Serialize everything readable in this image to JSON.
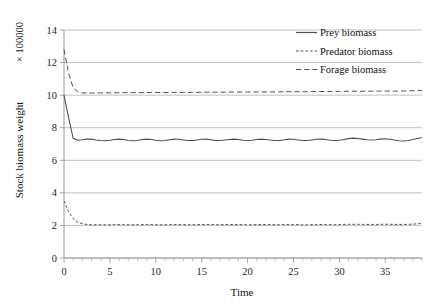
{
  "chart_data": {
    "type": "line",
    "title": "",
    "xlabel": "Time",
    "ylabel": "Stock biomass weight",
    "y_unit_label": "× 100000",
    "xlim": [
      0,
      39
    ],
    "ylim": [
      0,
      14
    ],
    "xticks": [
      0,
      5,
      10,
      15,
      20,
      25,
      30,
      35
    ],
    "xtick_labels": [
      "0",
      "5",
      "10",
      "15",
      "20",
      "25",
      "30",
      "35"
    ],
    "x_minor_tick_step": 1,
    "yticks": [
      0,
      2,
      4,
      6,
      8,
      10,
      12,
      14
    ],
    "ytick_labels": [
      "0",
      "2",
      "4",
      "6",
      "8",
      "10",
      "12",
      "14"
    ],
    "grid": "horizontal",
    "legend_position": "top-right",
    "legend_entries": [
      "Prey biomass",
      "Predator biomass",
      "Forage biomass"
    ],
    "x": [
      0,
      0.5,
      1,
      1.5,
      2,
      2.5,
      3,
      3.5,
      4,
      4.5,
      5,
      5.5,
      6,
      6.5,
      7,
      7.5,
      8,
      8.5,
      9,
      9.5,
      10,
      10.5,
      11,
      11.5,
      12,
      12.5,
      13,
      13.5,
      14,
      14.5,
      15,
      15.5,
      16,
      16.5,
      17,
      17.5,
      18,
      18.5,
      19,
      19.5,
      20,
      20.5,
      21,
      21.5,
      22,
      22.5,
      23,
      23.5,
      24,
      24.5,
      25,
      25.5,
      26,
      26.5,
      27,
      27.5,
      28,
      28.5,
      29,
      29.5,
      30,
      30.5,
      31,
      31.5,
      32,
      32.5,
      33,
      33.5,
      34,
      34.5,
      35,
      35.5,
      36,
      36.5,
      37,
      37.5,
      38,
      38.5,
      39
    ],
    "series": [
      {
        "name": "Prey biomass",
        "style": "solid",
        "color": "#4d4d4d",
        "values": [
          10.0,
          8.62,
          7.35,
          7.23,
          7.26,
          7.31,
          7.3,
          7.25,
          7.21,
          7.2,
          7.23,
          7.28,
          7.3,
          7.27,
          7.22,
          7.2,
          7.22,
          7.27,
          7.3,
          7.28,
          7.23,
          7.2,
          7.21,
          7.26,
          7.3,
          7.29,
          7.25,
          7.21,
          7.21,
          7.25,
          7.29,
          7.3,
          7.26,
          7.22,
          7.21,
          7.24,
          7.28,
          7.3,
          7.27,
          7.23,
          7.21,
          7.23,
          7.27,
          7.3,
          7.28,
          7.24,
          7.21,
          7.22,
          7.26,
          7.3,
          7.29,
          7.25,
          7.22,
          7.21,
          7.25,
          7.29,
          7.3,
          7.27,
          7.23,
          7.21,
          7.23,
          7.28,
          7.33,
          7.36,
          7.34,
          7.3,
          7.26,
          7.24,
          7.26,
          7.3,
          7.32,
          7.29,
          7.24,
          7.2,
          7.18,
          7.21,
          7.27,
          7.34,
          7.4
        ]
      },
      {
        "name": "Predator biomass",
        "style": "dashed-short",
        "color": "#4d4d4d",
        "values": [
          3.5,
          2.85,
          2.42,
          2.2,
          2.1,
          2.06,
          2.04,
          2.04,
          2.04,
          2.04,
          2.04,
          2.05,
          2.05,
          2.05,
          2.04,
          2.04,
          2.04,
          2.05,
          2.05,
          2.05,
          2.04,
          2.04,
          2.04,
          2.05,
          2.05,
          2.05,
          2.05,
          2.04,
          2.04,
          2.05,
          2.05,
          2.05,
          2.05,
          2.04,
          2.04,
          2.05,
          2.05,
          2.05,
          2.05,
          2.05,
          2.04,
          2.04,
          2.05,
          2.05,
          2.05,
          2.05,
          2.04,
          2.04,
          2.05,
          2.05,
          2.05,
          2.05,
          2.04,
          2.04,
          2.05,
          2.05,
          2.06,
          2.05,
          2.05,
          2.04,
          2.05,
          2.06,
          2.07,
          2.07,
          2.07,
          2.06,
          2.06,
          2.06,
          2.06,
          2.07,
          2.07,
          2.07,
          2.06,
          2.06,
          2.06,
          2.07,
          2.08,
          2.1,
          2.12
        ]
      },
      {
        "name": "Forage biomass",
        "style": "dashed-long",
        "color": "#4d4d4d",
        "values": [
          12.8,
          11.35,
          10.45,
          10.2,
          10.14,
          10.13,
          10.13,
          10.14,
          10.14,
          10.14,
          10.14,
          10.14,
          10.15,
          10.15,
          10.15,
          10.15,
          10.15,
          10.15,
          10.16,
          10.16,
          10.16,
          10.16,
          10.16,
          10.16,
          10.17,
          10.17,
          10.17,
          10.17,
          10.17,
          10.17,
          10.18,
          10.18,
          10.18,
          10.18,
          10.18,
          10.18,
          10.19,
          10.19,
          10.19,
          10.19,
          10.19,
          10.19,
          10.2,
          10.2,
          10.2,
          10.2,
          10.2,
          10.2,
          10.21,
          10.21,
          10.21,
          10.21,
          10.21,
          10.21,
          10.22,
          10.22,
          10.22,
          10.22,
          10.22,
          10.22,
          10.23,
          10.23,
          10.24,
          10.24,
          10.24,
          10.24,
          10.24,
          10.24,
          10.25,
          10.25,
          10.25,
          10.25,
          10.25,
          10.25,
          10.26,
          10.26,
          10.27,
          10.28,
          10.3
        ]
      }
    ]
  }
}
